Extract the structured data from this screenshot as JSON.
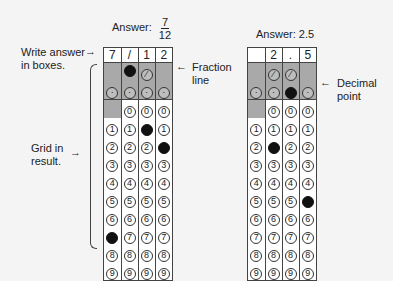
{
  "left": {
    "answer_label": "Answer:",
    "fraction": {
      "numerator": "7",
      "denominator": "12"
    },
    "boxes": [
      "7",
      "/",
      "1",
      "2"
    ],
    "slash_row": [
      false,
      "filled",
      "slash",
      false
    ],
    "decimal_row": [
      "dot",
      "dot",
      "dot",
      "dot"
    ],
    "filled_digits": [
      7,
      null,
      1,
      2
    ],
    "zero_row_enabled": [
      false,
      true,
      true,
      true
    ]
  },
  "right": {
    "answer_label": "Answer: 2.5",
    "boxes": [
      "",
      "2",
      ".",
      "5"
    ],
    "slash_row": [
      false,
      "slash",
      "slash",
      false
    ],
    "decimal_row": [
      "dot",
      "dot",
      "filled",
      "dot"
    ],
    "filled_digits": [
      null,
      2,
      null,
      5
    ],
    "zero_row_enabled": [
      false,
      true,
      true,
      true
    ]
  },
  "annotations": {
    "write_answer": "Write answer in boxes.",
    "write_answer_line1": "Write answer",
    "write_answer_line2": "in boxes.",
    "fraction_line_1": "Fraction",
    "fraction_line_2": "line",
    "grid_in_1": "Grid in",
    "grid_in_2": "result.",
    "decimal_point_1": "Decimal",
    "decimal_point_2": "point"
  },
  "digits": [
    "0",
    "1",
    "2",
    "3",
    "4",
    "5",
    "6",
    "7",
    "8",
    "9"
  ],
  "colors": {
    "shade": "#a9a9a9",
    "fill": "#111111",
    "background": "#f4f4f4"
  }
}
